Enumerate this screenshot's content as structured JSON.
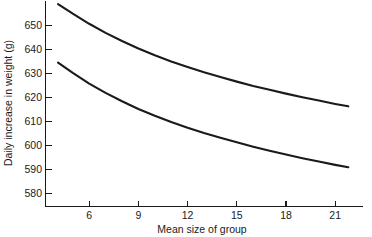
{
  "chart_data": {
    "type": "line",
    "title": "",
    "xlabel": "Mean size of group",
    "ylabel": "Daily increase in weight (g)",
    "xlim": [
      3.3,
      23.0
    ],
    "ylim": [
      575.0,
      656.0
    ],
    "xticks": [
      6,
      9,
      12,
      15,
      18,
      21
    ],
    "xtick_labels": [
      "6",
      "9",
      "12",
      "15",
      "18",
      "21"
    ],
    "yticks": [
      580,
      590,
      600,
      610,
      620,
      630,
      640,
      650
    ],
    "ytick_labels": [
      "580",
      "590",
      "600",
      "610",
      "620",
      "630",
      "640",
      "650"
    ],
    "grid": false,
    "legend": "none",
    "line_color": "#1a1a1a",
    "series": [
      {
        "name": "upper curve",
        "x": [
          4.1,
          5.0,
          6.0,
          7.0,
          8.0,
          9.0,
          10.0,
          11.0,
          12.0,
          13.0,
          14.0,
          15.0,
          16.0,
          17.0,
          18.0,
          19.0,
          20.0,
          21.0,
          21.8
        ],
        "values": [
          659.0,
          655.0,
          650.8,
          647.0,
          643.6,
          640.5,
          637.7,
          635.1,
          632.8,
          630.6,
          628.6,
          626.7,
          624.9,
          623.3,
          621.7,
          620.2,
          618.8,
          617.4,
          616.4
        ]
      },
      {
        "name": "lower curve",
        "x": [
          4.1,
          5.0,
          6.0,
          7.0,
          8.0,
          9.0,
          10.0,
          11.0,
          12.0,
          13.0,
          14.0,
          15.0,
          16.0,
          17.0,
          18.0,
          19.0,
          20.0,
          21.0,
          21.8
        ],
        "values": [
          634.6,
          630.3,
          625.9,
          622.0,
          618.5,
          615.3,
          612.5,
          609.9,
          607.5,
          605.3,
          603.3,
          601.4,
          599.6,
          597.9,
          596.3,
          594.8,
          593.4,
          592.0,
          591.0
        ]
      }
    ],
    "endpoints": {
      "upper_right_value": 611,
      "lower_right_value": 586,
      "upper_left_value": 659,
      "lower_left_value": 634
    }
  }
}
